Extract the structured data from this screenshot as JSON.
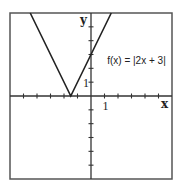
{
  "chart_data": {
    "type": "line",
    "title": "",
    "function": "f(x) = |2x + 3|",
    "annotation": "f(x) = |2x + 3|",
    "xlabel": "x",
    "ylabel": "y",
    "xlim": [
      -6,
      6
    ],
    "ylim": [
      -6,
      6
    ],
    "x_tick_step": 1,
    "y_tick_step": 1,
    "x_tick_labels": [
      {
        "value": 1,
        "label": "1"
      }
    ],
    "y_tick_labels": [
      {
        "value": 1,
        "label": "1"
      }
    ],
    "grid": false,
    "series": [
      {
        "name": "f(x) = |2x + 3|",
        "x": [
          -4.5,
          -1.5,
          1.5
        ],
        "y": [
          6,
          0,
          6
        ]
      }
    ],
    "vertex": {
      "x": -1.5,
      "y": 0
    },
    "colors": {
      "line": "#222222",
      "axes": "#333333",
      "frame": "#555555"
    }
  }
}
